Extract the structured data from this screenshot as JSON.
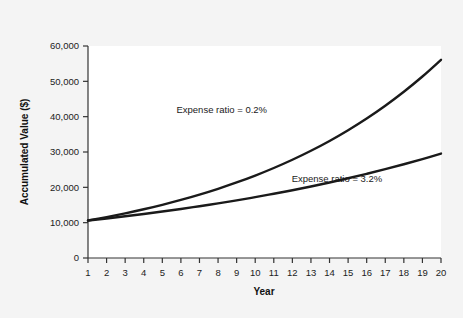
{
  "chart_data": {
    "type": "line",
    "title": "",
    "subtitle": "",
    "xlabel": "Year",
    "ylabel": "Accumulated Value ($)",
    "xlim": [
      1,
      20
    ],
    "ylim": [
      0,
      60000
    ],
    "grid": false,
    "legend_position": "inline-annotations",
    "x_tick_labels": [
      "1",
      "2",
      "3",
      "4",
      "5",
      "6",
      "7",
      "8",
      "9",
      "10",
      "11",
      "12",
      "13",
      "14",
      "15",
      "16",
      "17",
      "18",
      "19",
      "20"
    ],
    "y_tick_labels": [
      "0",
      "10,000",
      "20,000",
      "30,000",
      "40,000",
      "50,000",
      "60,000"
    ],
    "y_ticks": [
      0,
      10000,
      20000,
      30000,
      40000,
      50000,
      60000
    ],
    "x": [
      1,
      2,
      3,
      4,
      5,
      6,
      7,
      8,
      9,
      10,
      11,
      12,
      13,
      14,
      15,
      16,
      17,
      18,
      19,
      20
    ],
    "series": [
      {
        "name": "Expense ratio = 0.2%",
        "annotation": "Expense ratio = 0.2%",
        "color": "#1a1a1a",
        "values": [
          10600,
          11570,
          12630,
          13790,
          15050,
          16430,
          17940,
          19580,
          21370,
          23330,
          25470,
          27800,
          30350,
          33130,
          36170,
          39480,
          43100,
          47050,
          51360,
          56070
        ]
      },
      {
        "name": "Expense ratio = 3.2%",
        "annotation": "Expense ratio = 3.2%",
        "color": "#1a1a1a",
        "values": [
          10600,
          11190,
          11810,
          12460,
          13150,
          13880,
          14650,
          15460,
          16320,
          17220,
          18180,
          19190,
          20250,
          21370,
          22560,
          23810,
          25130,
          26530,
          28000,
          29560
        ]
      }
    ],
    "annotations": [
      {
        "text": "Expense ratio = 0.2%",
        "anchor_x": 8.2,
        "anchor_y": 41000
      },
      {
        "text": "Expense ratio = 3.2%",
        "anchor_x": 14.4,
        "anchor_y": 21500
      }
    ]
  },
  "figure": {
    "background_color": "#f4f4f4",
    "plot_background_color": "#ffffff",
    "axis_color": "#333333",
    "line_color": "#1a1a1a"
  }
}
